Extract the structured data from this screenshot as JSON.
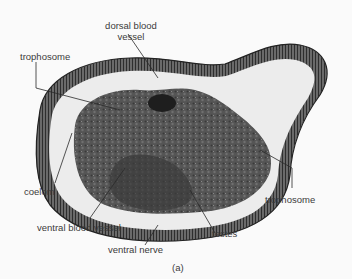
{
  "figure": {
    "caption": "(a)",
    "colors": {
      "background": "#fafafa",
      "tissue_dark": "#3c3c3c",
      "tissue_mid": "#5e5e5e",
      "body_wall": "#4a4a4a",
      "coelom": "#ececec",
      "leader_line": "#2a2a2a",
      "label_text": "#3a3a3a"
    },
    "labels": {
      "dorsal_blood_vessel_line1": "dorsal blood",
      "dorsal_blood_vessel_line2": "vessel",
      "trophosome_upper": "trophosome",
      "coelom": "coelom",
      "ventral_blood_vessel": "ventral blood vessel",
      "ventral_nerve": "ventral nerve",
      "testes": "testes",
      "trophosome_lower": "trophosome"
    }
  }
}
